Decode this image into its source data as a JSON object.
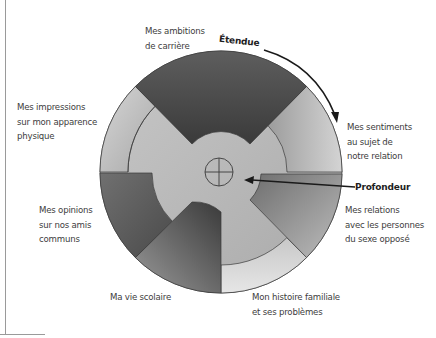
{
  "diagram": {
    "type": "social-penetration-wheel",
    "axes": {
      "breadth_label": "Étendue",
      "depth_label": "Profondeur"
    },
    "segments": [
      {
        "id": "ambitions",
        "lines": [
          "Mes ambitions",
          "de carrière"
        ],
        "shade": "dark"
      },
      {
        "id": "sentiments",
        "lines": [
          "Mes sentiments",
          "au sujet de",
          "notre relation"
        ],
        "shade": "light"
      },
      {
        "id": "relations",
        "lines": [
          "Mes relations",
          "avec les personnes",
          "du sexe opposé"
        ],
        "shade": "medium"
      },
      {
        "id": "histoire",
        "lines": [
          "Mon histoire familiale",
          "et ses problèmes"
        ],
        "shade": "light"
      },
      {
        "id": "scolaire",
        "lines": [
          "Ma vie scolaire"
        ],
        "shade": "dark"
      },
      {
        "id": "opinions",
        "lines": [
          "Mes opinions",
          "sur nos amis",
          "communs"
        ],
        "shade": "medium"
      },
      {
        "id": "impressions",
        "lines": [
          "Mes impressions",
          "sur mon apparence",
          "physique"
        ],
        "shade": "light"
      }
    ],
    "colors": {
      "outline": "#3a3a3a",
      "dark": "#4a4a4a",
      "medium": "#8a8a8a",
      "light": "#c4c4c4",
      "hub": "#bdbdbd",
      "arrow": "#1a1a1a"
    }
  }
}
